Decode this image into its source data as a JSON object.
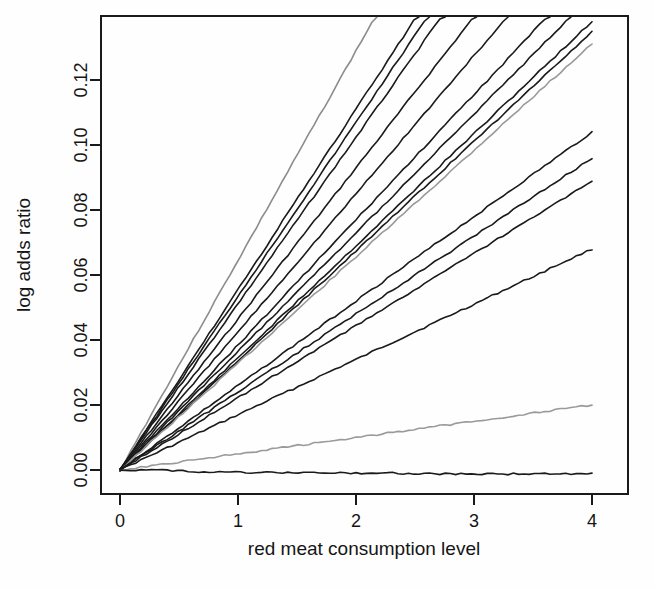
{
  "chart_data": {
    "type": "line",
    "title": "",
    "subtitle": "",
    "xlabel": "red meat consumption level",
    "ylabel": "log adds ratio",
    "xlim": [
      0,
      4
    ],
    "ylim": [
      -0.004,
      0.1375
    ],
    "grid": false,
    "legend": "none",
    "x_ticks": [
      "0",
      "1",
      "2",
      "3",
      "4"
    ],
    "x_tick_values": [
      0,
      1,
      2,
      3,
      4
    ],
    "y_ticks": [
      "0.00",
      "0.02",
      "0.04",
      "0.06",
      "0.08",
      "0.10",
      "0.12"
    ],
    "y_tick_values": [
      0.0,
      0.02,
      0.04,
      0.06,
      0.08,
      0.1,
      0.12
    ],
    "x": [
      0,
      0.25,
      0.5,
      0.75,
      1,
      1.25,
      1.5,
      1.75,
      2,
      2.25,
      2.5,
      2.75,
      3,
      3.25,
      3.5,
      3.75,
      4
    ],
    "series": [
      {
        "name": "line-01",
        "color": "#8c8c8c",
        "slope": 0.0645,
        "clipped_at_top": true,
        "values": [
          0,
          0.0161,
          0.0323,
          0.0484,
          0.0645,
          0.0806,
          0.0968,
          0.1129,
          0.129,
          0.1451,
          0.1613,
          0.1774,
          0.1935,
          0.2096,
          0.2258,
          0.2419,
          0.258
        ]
      },
      {
        "name": "line-02",
        "color": "#1a1a1a",
        "slope": 0.0555,
        "clipped_at_top": true,
        "values": [
          0,
          0.0139,
          0.0278,
          0.0416,
          0.0555,
          0.0694,
          0.0833,
          0.0971,
          0.111,
          0.1249,
          0.1388,
          0.1526,
          0.1665,
          0.1804,
          0.1943,
          0.2081,
          0.222
        ]
      },
      {
        "name": "line-03",
        "color": "#1a1a1a",
        "slope": 0.0535,
        "clipped_at_top": true,
        "values": [
          0,
          0.0134,
          0.0268,
          0.0401,
          0.0535,
          0.0669,
          0.0803,
          0.0936,
          0.107,
          0.1204,
          0.1338,
          0.1471,
          0.1605,
          0.1739,
          0.1873,
          0.2006,
          0.214
        ]
      },
      {
        "name": "line-04",
        "color": "#1a1a1a",
        "slope": 0.0512,
        "clipped_at_top": true,
        "values": [
          0,
          0.0128,
          0.0256,
          0.0384,
          0.0512,
          0.064,
          0.0768,
          0.0896,
          0.1024,
          0.1152,
          0.128,
          0.1408,
          0.1536,
          0.1664,
          0.1792,
          0.192,
          0.2048
        ]
      },
      {
        "name": "line-05",
        "color": "#1a1a1a",
        "slope": 0.0465,
        "clipped_at_top": true,
        "values": [
          0,
          0.0116,
          0.0233,
          0.0349,
          0.0465,
          0.0581,
          0.0698,
          0.0814,
          0.093,
          0.1046,
          0.1163,
          0.1279,
          0.1395,
          0.1511,
          0.1628,
          0.1744,
          0.186
        ]
      },
      {
        "name": "line-06",
        "color": "#1a1a1a",
        "slope": 0.0425,
        "clipped_at_top": true,
        "values": [
          0,
          0.0106,
          0.0213,
          0.0319,
          0.0425,
          0.0531,
          0.0638,
          0.0744,
          0.085,
          0.0956,
          0.1063,
          0.1169,
          0.1275,
          0.1381,
          0.1488,
          0.1594,
          0.17
        ]
      },
      {
        "name": "line-07",
        "color": "#1a1a1a",
        "slope": 0.0385,
        "clipped_at_top": true,
        "values": [
          0,
          0.0096,
          0.0193,
          0.0289,
          0.0385,
          0.0481,
          0.0578,
          0.0674,
          0.077,
          0.0866,
          0.0963,
          0.1059,
          0.1155,
          0.1251,
          0.1348,
          0.1444,
          0.154
        ]
      },
      {
        "name": "line-08",
        "color": "#1a1a1a",
        "slope": 0.0365,
        "clipped_at_top": true,
        "values": [
          0,
          0.0091,
          0.0183,
          0.0274,
          0.0365,
          0.0456,
          0.0548,
          0.0639,
          0.073,
          0.0821,
          0.0913,
          0.1004,
          0.1095,
          0.1186,
          0.1278,
          0.1369,
          0.146
        ]
      },
      {
        "name": "line-09",
        "color": "#1a1a1a",
        "slope": 0.0345,
        "clipped_at_top": true,
        "values": [
          0,
          0.0086,
          0.0173,
          0.0259,
          0.0345,
          0.0431,
          0.0518,
          0.0604,
          0.069,
          0.0776,
          0.0863,
          0.0949,
          0.1035,
          0.1121,
          0.1208,
          0.1294,
          0.138
        ]
      },
      {
        "name": "line-10",
        "color": "#1a1a1a",
        "slope": 0.0337,
        "clipped_at_top": true,
        "values": [
          0,
          0.0084,
          0.0169,
          0.0253,
          0.0337,
          0.0421,
          0.0506,
          0.059,
          0.0674,
          0.0758,
          0.0843,
          0.0927,
          0.1011,
          0.1095,
          0.118,
          0.1264,
          0.1348
        ]
      },
      {
        "name": "line-11",
        "color": "#9a9a9a",
        "slope": 0.0328,
        "clipped_at_top": true,
        "values": [
          0,
          0.0082,
          0.0164,
          0.0246,
          0.0328,
          0.041,
          0.0492,
          0.0574,
          0.0656,
          0.0738,
          0.082,
          0.0902,
          0.0984,
          0.1066,
          0.1148,
          0.123,
          0.1312
        ]
      },
      {
        "name": "line-12",
        "color": "#1a1a1a",
        "slope": 0.026,
        "clipped_at_top": false,
        "values": [
          0,
          0.0065,
          0.013,
          0.0195,
          0.026,
          0.0325,
          0.039,
          0.0455,
          0.052,
          0.0585,
          0.065,
          0.0715,
          0.078,
          0.0845,
          0.091,
          0.0975,
          0.104
        ]
      },
      {
        "name": "line-13",
        "color": "#1a1a1a",
        "slope": 0.024,
        "clipped_at_top": false,
        "values": [
          0,
          0.006,
          0.012,
          0.018,
          0.024,
          0.03,
          0.036,
          0.042,
          0.048,
          0.054,
          0.06,
          0.066,
          0.072,
          0.078,
          0.084,
          0.09,
          0.096
        ]
      },
      {
        "name": "line-14",
        "color": "#1a1a1a",
        "slope": 0.0222,
        "clipped_at_top": false,
        "values": [
          0,
          0.0056,
          0.0111,
          0.0167,
          0.0222,
          0.0278,
          0.0333,
          0.0389,
          0.0444,
          0.05,
          0.0555,
          0.0611,
          0.0666,
          0.0722,
          0.0777,
          0.0833,
          0.0888
        ]
      },
      {
        "name": "line-15",
        "color": "#1a1a1a",
        "slope": 0.017,
        "clipped_at_top": false,
        "values": [
          0,
          0.0043,
          0.0085,
          0.0128,
          0.017,
          0.0213,
          0.0255,
          0.0298,
          0.034,
          0.0383,
          0.0425,
          0.0468,
          0.051,
          0.0553,
          0.0595,
          0.0638,
          0.068
        ]
      },
      {
        "name": "line-16",
        "color": "#9a9a9a",
        "slope": 0.005,
        "clipped_at_top": false,
        "values": [
          0,
          0.00125,
          0.0025,
          0.00375,
          0.005,
          0.00625,
          0.0075,
          0.00875,
          0.01,
          0.01125,
          0.0125,
          0.01375,
          0.015,
          0.01625,
          0.0175,
          0.01875,
          0.02
        ]
      },
      {
        "name": "line-17",
        "color": "#1a1a1a",
        "slope": -0.0003,
        "clipped_at_top": false,
        "values": [
          0,
          -5e-05,
          -0.0001,
          -0.0007,
          -0.0008,
          -0.0008,
          -0.0008,
          -0.0009,
          -0.0009,
          -0.0009,
          -0.0011,
          -0.0012,
          -0.0012,
          -0.0012,
          -0.0012,
          -0.0012,
          -0.0012
        ]
      }
    ]
  },
  "axes": {
    "x_title": "red meat consumption level",
    "y_title": "log adds ratio"
  }
}
